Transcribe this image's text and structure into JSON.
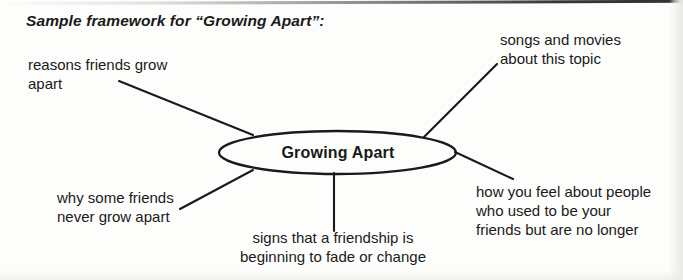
{
  "document": {
    "title": "Sample framework for “Growing Apart”:"
  },
  "diagram": {
    "type": "mind-map",
    "center": {
      "label": "Growing Apart"
    },
    "branches": [
      {
        "id": "reasons",
        "label": "reasons friends grow\napart",
        "position": "top-left"
      },
      {
        "id": "songs",
        "label": "songs and movies\nabout this topic",
        "position": "top-right"
      },
      {
        "id": "why",
        "label": "why some friends\nnever grow apart",
        "position": "bottom-left"
      },
      {
        "id": "signs",
        "label": "signs that a friendship is\nbeginning to fade or change",
        "position": "bottom-center"
      },
      {
        "id": "how",
        "label": "how you feel about people\nwho used to be your\nfriends but are no longer",
        "position": "bottom-right"
      }
    ],
    "colors": {
      "ink": "#1a1a1a",
      "background": "#fdfdfc"
    }
  }
}
